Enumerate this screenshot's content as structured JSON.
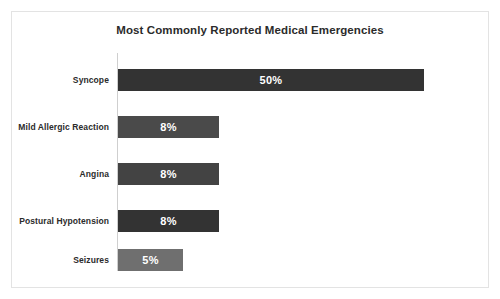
{
  "chart_data": {
    "type": "bar",
    "orientation": "horizontal",
    "title": "Most Commonly Reported Medical Emergencies",
    "xlabel": "",
    "ylabel": "",
    "grid": false,
    "legend": "none",
    "categories": [
      "Syncope",
      "Mild Allergic Reaction",
      "Angina",
      "Postural Hypotension",
      "Seizures"
    ],
    "values": [
      50,
      8,
      8,
      8,
      5
    ],
    "data_labels": [
      "50%",
      "8%",
      "8%",
      "8%",
      "5%"
    ],
    "bar_colors": [
      "#333333",
      "#4a4a4a",
      "#434343",
      "#333333",
      "#6f6f6f"
    ],
    "bar_pixel_widths": [
      306,
      101,
      101,
      101,
      65
    ],
    "value_label_color": "#ffffff"
  },
  "style": {
    "background": "#ffffff",
    "frame_border": "#e3e3e3",
    "axis_color": "#cfcfcf",
    "title_color": "#2b2b2b",
    "label_color": "#2b2b2b"
  }
}
